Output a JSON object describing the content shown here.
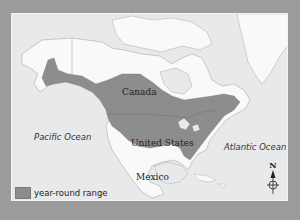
{
  "map": {
    "title": "year-round range map of North America",
    "colors": {
      "border": "#9c9c9c",
      "ocean": "#e7e9eb",
      "land": "#f9f9f9",
      "range": "#8d8d8d",
      "coastline": "#b5b5b5"
    },
    "labels": {
      "canada": "Canada",
      "united_states": "United States",
      "mexico": "Mexico",
      "pacific": "Pacific Ocean",
      "atlantic": "Atlantic Ocean"
    },
    "legend": {
      "items": [
        {
          "label": "year-round range",
          "color": "#8d8d8d"
        }
      ]
    },
    "compass": {
      "north_label": "N"
    }
  }
}
